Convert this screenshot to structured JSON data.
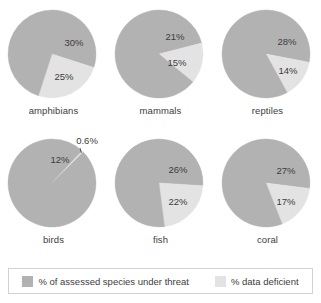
{
  "chart_data": {
    "type": "pie",
    "title": "",
    "legend_position": "bottom",
    "colors": {
      "threat": "#b2b2b2",
      "deficient": "#e3e3e3"
    },
    "legend": [
      {
        "key": "threat",
        "label": "% of assessed species under threat",
        "color": "#b2b2b2"
      },
      {
        "key": "deficient",
        "label": "% data deficient",
        "color": "#e3e3e3"
      }
    ],
    "series": [
      {
        "name": "% of assessed species under threat",
        "values": [
          30,
          21,
          28,
          12,
          26,
          27
        ]
      },
      {
        "name": "% data deficient",
        "values": [
          25,
          15,
          14,
          0.6,
          22,
          17
        ]
      }
    ],
    "categories": [
      "amphibians",
      "mammals",
      "reptiles",
      "birds",
      "fish",
      "coral"
    ],
    "pies": [
      {
        "name": "amphibians",
        "label": "amphibians",
        "slices": [
          {
            "key": "threat",
            "value": 30,
            "label": "30%",
            "label_x": 72,
            "label_y": 42,
            "callout": false
          },
          {
            "key": "deficient",
            "value": 25,
            "label": "25%",
            "label_x": 62,
            "label_y": 76,
            "callout": false
          },
          {
            "key": "rest",
            "value": 45,
            "label": "",
            "callout": false
          }
        ]
      },
      {
        "name": "mammals",
        "label": "mammals",
        "slices": [
          {
            "key": "threat",
            "value": 21,
            "label": "21%",
            "label_x": 66,
            "label_y": 36,
            "callout": false
          },
          {
            "key": "deficient",
            "value": 15,
            "label": "15%",
            "label_x": 68,
            "label_y": 62,
            "callout": false
          },
          {
            "key": "rest",
            "value": 64,
            "label": "",
            "callout": false
          }
        ]
      },
      {
        "name": "reptiles",
        "label": "reptiles",
        "slices": [
          {
            "key": "threat",
            "value": 28,
            "label": "28%",
            "label_x": 71,
            "label_y": 41,
            "callout": false
          },
          {
            "key": "deficient",
            "value": 14,
            "label": "14%",
            "label_x": 72,
            "label_y": 70,
            "callout": false
          },
          {
            "key": "rest",
            "value": 58,
            "label": "",
            "callout": false
          }
        ]
      },
      {
        "name": "birds",
        "label": "birds",
        "slices": [
          {
            "key": "threat",
            "value": 12,
            "label": "12%",
            "label_x": 58,
            "label_y": 30,
            "callout": false
          },
          {
            "key": "deficient",
            "value": 0.6,
            "label": "0.6%",
            "label_x": 85,
            "label_y": 11,
            "callout": true
          },
          {
            "key": "rest",
            "value": 87.4,
            "label": "",
            "callout": false
          }
        ]
      },
      {
        "name": "fish",
        "label": "fish",
        "slices": [
          {
            "key": "threat",
            "value": 26,
            "label": "26%",
            "label_x": 69,
            "label_y": 40,
            "callout": false
          },
          {
            "key": "deficient",
            "value": 22,
            "label": "22%",
            "label_x": 69,
            "label_y": 72,
            "callout": false
          },
          {
            "key": "rest",
            "value": 52,
            "label": "",
            "callout": false
          }
        ]
      },
      {
        "name": "coral",
        "label": "coral",
        "slices": [
          {
            "key": "threat",
            "value": 27,
            "label": "27%",
            "label_x": 70,
            "label_y": 41,
            "callout": false
          },
          {
            "key": "deficient",
            "value": 17,
            "label": "17%",
            "label_x": 70,
            "label_y": 72,
            "callout": false
          },
          {
            "key": "rest",
            "value": 56,
            "label": "",
            "callout": false
          }
        ]
      }
    ]
  }
}
